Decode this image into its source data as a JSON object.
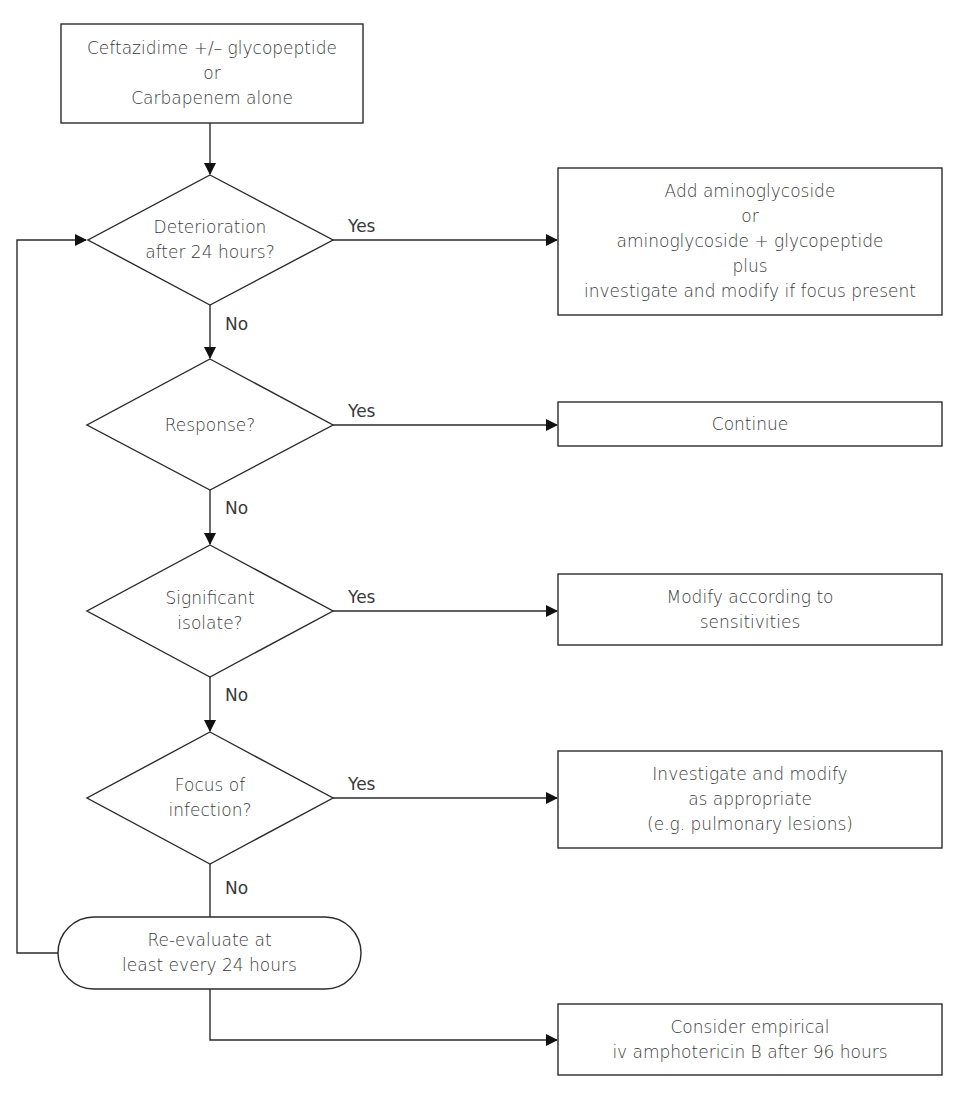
{
  "flowchart": {
    "start": {
      "lines": [
        "Ceftazidime +/– glycopeptide",
        "or",
        "Carbapenem alone"
      ]
    },
    "decisions": [
      {
        "lines": [
          "Deterioration",
          "after 24 hours?"
        ],
        "yes_label": "Yes",
        "no_label": "No"
      },
      {
        "lines": [
          "Response?"
        ],
        "yes_label": "Yes",
        "no_label": "No"
      },
      {
        "lines": [
          "Significant",
          "isolate?"
        ],
        "yes_label": "Yes",
        "no_label": "No"
      },
      {
        "lines": [
          "Focus of",
          "infection?"
        ],
        "yes_label": "Yes",
        "no_label": "No"
      }
    ],
    "actions": [
      {
        "lines": [
          "Add aminoglycoside",
          "or",
          "aminoglycoside + glycopeptide",
          "plus",
          "investigate and modify if focus present"
        ]
      },
      {
        "lines": [
          "Continue"
        ]
      },
      {
        "lines": [
          "Modify according to",
          "sensitivities"
        ]
      },
      {
        "lines": [
          "Investigate and modify",
          "as appropriate",
          "(e.g. pulmonary lesions)"
        ]
      }
    ],
    "reevaluate": {
      "lines": [
        "Re-evaluate at",
        "least every 24 hours"
      ]
    },
    "final": {
      "lines": [
        "Consider empirical",
        "iv amphotericin B after 96 hours"
      ]
    }
  },
  "colors": {
    "stroke": "#2b2b2b",
    "text": "#3a3a3a",
    "background": "#ffffff"
  }
}
